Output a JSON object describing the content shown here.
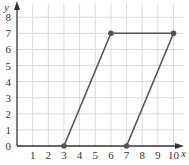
{
  "chart_data": {
    "type": "line",
    "title": "",
    "xlabel": "x",
    "ylabel": "y",
    "xlim": [
      0,
      10
    ],
    "ylim": [
      0,
      8
    ],
    "x_ticks": [
      "1",
      "2",
      "3",
      "4",
      "5",
      "6",
      "7",
      "8",
      "9",
      "10"
    ],
    "y_ticks": [
      "0",
      "1",
      "2",
      "3",
      "4",
      "5",
      "6",
      "7",
      "8"
    ],
    "grid": true,
    "series": [
      {
        "name": "parallelogram",
        "points": [
          [
            3,
            0
          ],
          [
            6,
            7
          ],
          [
            10,
            7
          ],
          [
            7,
            0
          ]
        ],
        "segments": [
          [
            [
              3,
              0
            ],
            [
              6,
              7
            ]
          ],
          [
            [
              6,
              7
            ],
            [
              10,
              7
            ]
          ],
          [
            [
              10,
              7
            ],
            [
              7,
              0
            ]
          ]
        ]
      }
    ]
  },
  "colors": {
    "grid": "#d9d9d9",
    "axis": "#333333",
    "line": "#555555",
    "point": "#555555"
  }
}
